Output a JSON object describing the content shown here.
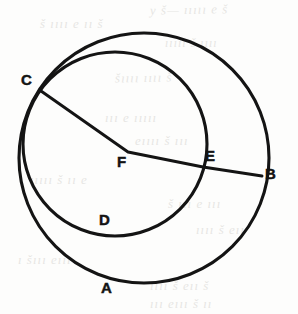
{
  "figure": {
    "kind": "hand-drawn-geometry-scan",
    "background_color": "#fdfdfc",
    "ink_color": "#141414",
    "bleed_color": "#c9c6c2",
    "caption": "",
    "shapes": {
      "outer_circle": {
        "name": "outer-circle",
        "cx": 144,
        "cy": 158,
        "r": 125,
        "stroke_width": 3.1
      },
      "inner_circle": {
        "name": "inner-circle",
        "cx": 115,
        "cy": 144,
        "r": 92,
        "stroke_width": 3.1
      },
      "chord_cb": {
        "name": "segment-C-F-E-B",
        "points": "41,91 128,152 203,167 262,176",
        "stroke_width": 2.9
      }
    },
    "points": [
      {
        "id": "C",
        "label": "C",
        "x": 21,
        "y": 72,
        "at_x": 41,
        "at_y": 91,
        "on": "circle-intersection"
      },
      {
        "id": "F",
        "label": "F",
        "x": 117,
        "y": 154,
        "at_x": 128,
        "at_y": 152,
        "on": "center-vertex"
      },
      {
        "id": "E",
        "label": "E",
        "x": 205,
        "y": 148,
        "at_x": 203,
        "at_y": 167,
        "on": "inner-circle"
      },
      {
        "id": "B",
        "label": "B",
        "x": 265,
        "y": 166,
        "at_x": 262,
        "at_y": 176,
        "on": "outer-circle"
      },
      {
        "id": "D",
        "label": "D",
        "x": 99,
        "y": 212,
        "at_x": 118,
        "at_y": 236,
        "on": "inner-circle"
      },
      {
        "id": "A",
        "label": "A",
        "x": 101,
        "y": 280,
        "at_x": 120,
        "at_y": 283,
        "on": "outer-circle"
      }
    ],
    "bleed_text": [
      {
        "text": "y š— ııııı е š",
        "x": 150,
        "y": 2,
        "size": 13,
        "rotate": -1
      },
      {
        "text": "š ıııı е ıı š",
        "x": 40,
        "y": 16,
        "size": 13,
        "rotate": 0
      },
      {
        "text": "ııııı š ıııı",
        "x": 165,
        "y": 36,
        "size": 12,
        "rotate": 0
      },
      {
        "text": "šıııı ıııı š",
        "x": 115,
        "y": 70,
        "size": 13,
        "rotate": -1
      },
      {
        "text": "ııı е ııııı",
        "x": 105,
        "y": 110,
        "size": 13,
        "rotate": 0
      },
      {
        "text": "еıııı š ııı",
        "x": 135,
        "y": 133,
        "size": 13,
        "rotate": 0
      },
      {
        "text": "ııııı š ıı е",
        "x": 30,
        "y": 172,
        "size": 13,
        "rotate": 0
      },
      {
        "text": "š ııı е ııı",
        "x": 168,
        "y": 196,
        "size": 13,
        "rotate": 0
      },
      {
        "text": "ıııı š еıı",
        "x": 196,
        "y": 222,
        "size": 13,
        "rotate": 0
      },
      {
        "text": "ı šııı еııı",
        "x": 18,
        "y": 252,
        "size": 13,
        "rotate": 0
      },
      {
        "text": "ıııı š еıı š",
        "x": 150,
        "y": 278,
        "size": 13,
        "rotate": 0
      },
      {
        "text": "ııı еııı š ıı",
        "x": 150,
        "y": 296,
        "size": 13,
        "rotate": 0
      }
    ]
  }
}
